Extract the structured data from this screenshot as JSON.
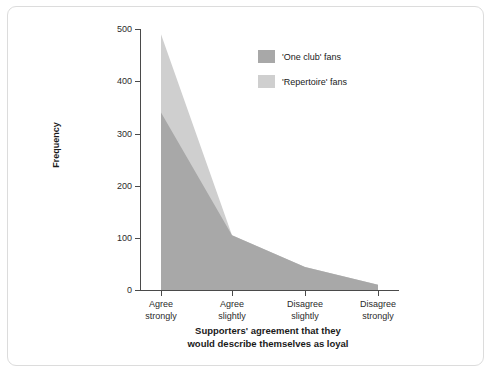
{
  "chart_data": {
    "type": "area",
    "title": "",
    "subtitle": "",
    "xlabel_line1": "Supporters' agreement that they",
    "xlabel_line2": "would describe themselves as loyal",
    "ylabel": "Frequency",
    "categories": [
      "Agree strongly",
      "Agree slightly",
      "Disagree slightly",
      "Disagree strongly"
    ],
    "category_lines": [
      [
        "Agree",
        "strongly"
      ],
      [
        "Agree",
        "slightly"
      ],
      [
        "Disagree",
        "slightly"
      ],
      [
        "Disagree",
        "strongly"
      ]
    ],
    "series": [
      {
        "name": "'One club' fans",
        "values": [
          340,
          105,
          44,
          10
        ],
        "color": "#a8a8a8"
      },
      {
        "name": "'Repertoire' fans",
        "values": [
          490,
          105,
          44,
          10
        ],
        "color": "#cfcfcf"
      }
    ],
    "ylim": [
      0,
      500
    ],
    "yticks": [
      0,
      100,
      200,
      300,
      400,
      500
    ],
    "ytick_labels": [
      "0",
      "100",
      "200",
      "300",
      "400",
      "500"
    ],
    "grid": false,
    "legend_position": "upper right",
    "legend_entries": [
      {
        "label": "'One club' fans",
        "color": "#a8a8a8"
      },
      {
        "label": "'Repertoire' fans",
        "color": "#cfcfcf"
      }
    ]
  },
  "frame": {
    "border_color": "#dcdcdc",
    "background": "#ffffff"
  }
}
